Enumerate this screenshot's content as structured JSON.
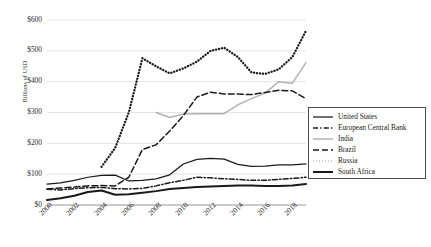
{
  "chart_data": {
    "type": "line",
    "title": "",
    "xlabel": "",
    "ylabel": "Billions of USD",
    "xlim": [
      2000,
      2019
    ],
    "ylim": [
      0,
      600
    ],
    "grid": true,
    "legend_position": "right",
    "ytick_labels": [
      "$600",
      "$500",
      "$400",
      "$300",
      "$200",
      "$100",
      "$0"
    ],
    "ytick_values": [
      600,
      500,
      400,
      300,
      200,
      100,
      0
    ],
    "xtick_labels": [
      "2000",
      "2002",
      "2004",
      "2006",
      "2008",
      "2010",
      "2012",
      "2014",
      "2016",
      "2018"
    ],
    "xtick_values": [
      2000,
      2002,
      2004,
      2006,
      2008,
      2010,
      2012,
      2014,
      2016,
      2018
    ],
    "x": [
      2000,
      2001,
      2002,
      2003,
      2004,
      2005,
      2006,
      2007,
      2008,
      2009,
      2010,
      2011,
      2012,
      2013,
      2014,
      2015,
      2016,
      2017,
      2018,
      2019
    ],
    "series": [
      {
        "name": "United States",
        "style": "solid-thin",
        "color": "#1a1a1a",
        "values": [
          68,
          72,
          80,
          90,
          96,
          97,
          78,
          80,
          85,
          98,
          133,
          148,
          151,
          149,
          132,
          125,
          126,
          130,
          130,
          133
        ]
      },
      {
        "name": "European Central Bank",
        "style": "dash-dot",
        "color": "#1a1a1a",
        "values": [
          51,
          49,
          53,
          56,
          57,
          53,
          52,
          54,
          62,
          72,
          80,
          90,
          88,
          85,
          83,
          80,
          80,
          83,
          86,
          90
        ]
      },
      {
        "name": "India",
        "style": "solid-gray",
        "color": "#b3b3b3",
        "values": [
          null,
          null,
          null,
          null,
          null,
          null,
          null,
          null,
          300,
          284,
          295,
          296,
          296,
          296,
          325,
          345,
          363,
          400,
          395,
          462
        ]
      },
      {
        "name": "Brazil",
        "style": "long-dash",
        "color": "#1a1a1a",
        "values": [
          52,
          55,
          58,
          62,
          63,
          62,
          90,
          180,
          195,
          240,
          290,
          350,
          366,
          360,
          360,
          358,
          365,
          372,
          370,
          345
        ]
      },
      {
        "name": "Russia",
        "style": "dotted",
        "color": "#1a1a1a",
        "values": [
          null,
          null,
          null,
          null,
          124,
          185,
          300,
          476,
          450,
          427,
          443,
          465,
          500,
          510,
          480,
          430,
          425,
          440,
          480,
          565
        ]
      },
      {
        "name": "South Africa",
        "style": "solid-thick",
        "color": "#1a1a1a",
        "values": [
          16,
          22,
          30,
          42,
          47,
          33,
          35,
          40,
          45,
          52,
          55,
          58,
          60,
          62,
          63,
          63,
          62,
          62,
          63,
          68
        ]
      }
    ]
  }
}
